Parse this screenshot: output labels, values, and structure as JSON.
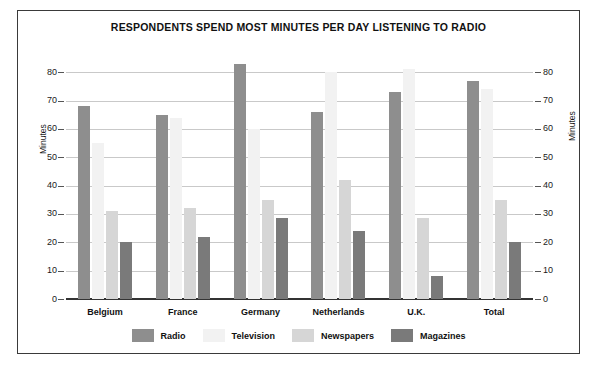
{
  "chart_data": {
    "type": "bar",
    "title": "RESPONDENTS SPEND MOST MINUTES PER DAY LISTENING TO RADIO",
    "xlabel": "",
    "ylabel": "Minutes",
    "ylabel_right": "Minutes",
    "ylim": [
      0,
      85
    ],
    "yticks": [
      0,
      10,
      20,
      30,
      40,
      50,
      60,
      70,
      80
    ],
    "ytick_labels": [
      "0",
      "10",
      "20",
      "30",
      "40",
      "50",
      "60",
      "70",
      "80"
    ],
    "grid": true,
    "legend_position": "bottom",
    "categories": [
      "Belgium",
      "France",
      "Germany",
      "Netherlands",
      "U.K.",
      "Total"
    ],
    "series": [
      {
        "name": "Radio",
        "color": "#8e8e8e",
        "values": [
          68,
          65,
          83,
          66,
          73,
          77
        ]
      },
      {
        "name": "Television",
        "color": "#f2f2f2",
        "values": [
          55,
          64,
          60,
          80,
          81,
          74
        ]
      },
      {
        "name": "Newspapers",
        "color": "#d6d6d6",
        "values": [
          31,
          32,
          35,
          42,
          28.5,
          35
        ]
      },
      {
        "name": "Magazines",
        "color": "#7a7a7a",
        "values": [
          20,
          22,
          28.5,
          24,
          8,
          20
        ]
      }
    ]
  },
  "colors": {
    "grid": "#c9c9c9",
    "axis": "#333333",
    "border": "#3a3a3a",
    "background": "#ffffff",
    "text": "#111111"
  }
}
